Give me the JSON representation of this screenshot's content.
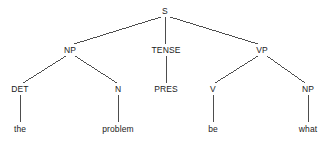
{
  "figure": {
    "type": "syntax-tree",
    "sentence": "the problem be what",
    "background_color": "#ffffff",
    "text_color": "#1a1a1a",
    "edge_color": "#3a3a3a"
  },
  "nodes": [
    {
      "id": "s",
      "label": "S",
      "kind": "category",
      "x": 165,
      "y": 11,
      "level": 0
    },
    {
      "id": "np1",
      "label": "NP",
      "kind": "category",
      "x": 70,
      "y": 50,
      "level": 1
    },
    {
      "id": "tense",
      "label": "TENSE",
      "kind": "category",
      "x": 166,
      "y": 50,
      "level": 1
    },
    {
      "id": "vp",
      "label": "VP",
      "kind": "category",
      "x": 262,
      "y": 50,
      "level": 1
    },
    {
      "id": "det",
      "label": "DET",
      "kind": "category",
      "x": 20,
      "y": 89,
      "level": 2
    },
    {
      "id": "n",
      "label": "N",
      "kind": "category",
      "x": 118,
      "y": 89,
      "level": 2
    },
    {
      "id": "pres",
      "label": "PRES",
      "kind": "category",
      "x": 166,
      "y": 89,
      "level": 2
    },
    {
      "id": "v",
      "label": "V",
      "kind": "category",
      "x": 213,
      "y": 89,
      "level": 2
    },
    {
      "id": "np2",
      "label": "NP",
      "kind": "category",
      "x": 308,
      "y": 89,
      "level": 2
    },
    {
      "id": "the",
      "label": "the",
      "kind": "word",
      "x": 20,
      "y": 129,
      "level": 3
    },
    {
      "id": "problem",
      "label": "problem",
      "kind": "word",
      "x": 118,
      "y": 129,
      "level": 3
    },
    {
      "id": "be",
      "label": "be",
      "kind": "word",
      "x": 213,
      "y": 129,
      "level": 3
    },
    {
      "id": "what",
      "label": "what",
      "kind": "word",
      "x": 308,
      "y": 129,
      "level": 3
    }
  ],
  "edges": [
    {
      "from": "s",
      "to": "np1",
      "x1": 161,
      "y1": 17,
      "x2": 74,
      "y2": 44
    },
    {
      "from": "s",
      "to": "tense",
      "x1": 165,
      "y1": 17,
      "x2": 166,
      "y2": 44
    },
    {
      "from": "s",
      "to": "vp",
      "x1": 170,
      "y1": 17,
      "x2": 258,
      "y2": 44
    },
    {
      "from": "np1",
      "to": "det",
      "x1": 66,
      "y1": 56,
      "x2": 23,
      "y2": 83
    },
    {
      "from": "np1",
      "to": "n",
      "x1": 75,
      "y1": 56,
      "x2": 117,
      "y2": 83
    },
    {
      "from": "tense",
      "to": "pres",
      "x1": 166,
      "y1": 56,
      "x2": 166,
      "y2": 83
    },
    {
      "from": "vp",
      "to": "v",
      "x1": 258,
      "y1": 56,
      "x2": 215,
      "y2": 83
    },
    {
      "from": "vp",
      "to": "np2",
      "x1": 267,
      "y1": 56,
      "x2": 305,
      "y2": 83
    },
    {
      "from": "det",
      "to": "the",
      "x1": 20,
      "y1": 95,
      "x2": 20,
      "y2": 122
    },
    {
      "from": "n",
      "to": "problem",
      "x1": 118,
      "y1": 95,
      "x2": 118,
      "y2": 122
    },
    {
      "from": "v",
      "to": "be",
      "x1": 213,
      "y1": 95,
      "x2": 213,
      "y2": 122
    },
    {
      "from": "np2",
      "to": "what",
      "x1": 308,
      "y1": 95,
      "x2": 308,
      "y2": 122
    }
  ]
}
